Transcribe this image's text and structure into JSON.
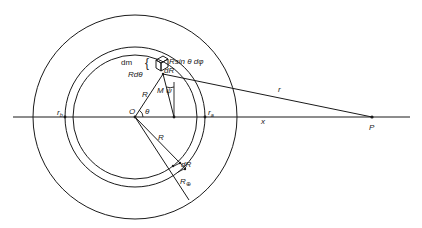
{
  "figure": {
    "type": "geometry-diagram",
    "colors": {
      "stroke": "#1a1a1a",
      "background": "#ffffff"
    }
  },
  "geometry": {
    "center": {
      "x": 135,
      "y": 117
    },
    "outer_radius": 102,
    "shell_outer_radius": 70,
    "shell_inner_radius": 62,
    "axis": {
      "x1": 13,
      "x2": 410,
      "y": 117
    },
    "point_M": {
      "x": 163,
      "y": 74
    },
    "point_P": {
      "x": 372,
      "y": 117
    },
    "foot_M": {
      "x": 174,
      "y": 117
    }
  },
  "labels": {
    "dm": "dm",
    "brace": "{",
    "Rdtheta": "Rdθ",
    "Rsin": "Rsin θ dφ",
    "dR_top": "dR",
    "R_upper": "R",
    "M": "M",
    "psi": "ψ",
    "O": "O",
    "theta": "θ",
    "r_b_main": "r",
    "r_b_sub": "b",
    "r_a_main": "r",
    "r_a_sub": "a",
    "x": "x",
    "r": "r",
    "P": "P",
    "R_lower": "R",
    "dR_lower": "dR",
    "R_earth_main": "R",
    "R_earth_sub": "⊕"
  }
}
